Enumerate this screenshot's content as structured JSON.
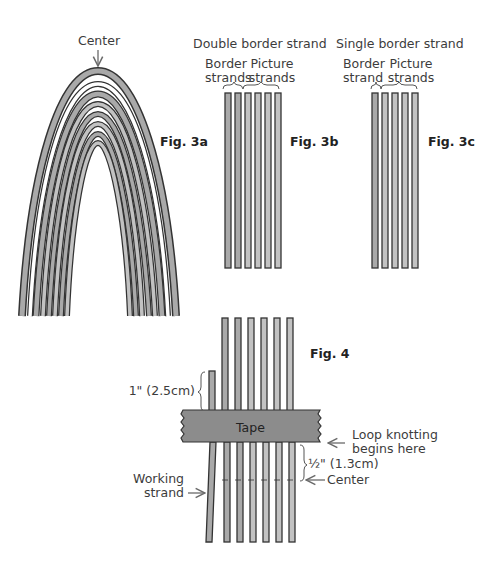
{
  "fig3a": {
    "label": "Fig. 3a",
    "center_label": "Center",
    "arch_strands": 8
  },
  "fig3b": {
    "label": "Fig. 3b",
    "title": "Double border strand",
    "group1": [
      "Border",
      "strands"
    ],
    "group2": [
      "Picture",
      "strands"
    ],
    "border_count": 2,
    "picture_count": 4
  },
  "fig3c": {
    "label": "Fig. 3c",
    "title": "Single border strand",
    "group1": [
      "Border",
      "strand"
    ],
    "group2": [
      "Picture",
      "strands"
    ],
    "border_count": 1,
    "picture_count": 4
  },
  "fig4": {
    "label": "Fig. 4",
    "tape": "Tape",
    "stub_length": "1\" (2.5cm)",
    "gap_length": "½\" (1.3cm)",
    "loop_label": [
      "Loop knotting",
      "begins here"
    ],
    "center_label": "Center",
    "working_label": [
      "Working",
      "strand"
    ]
  },
  "colors": {
    "strand_fill": "#a9a9a9",
    "strand_outline": "#333333",
    "tape_fill": "#8c8c8c",
    "arrow": "#6a6a6a"
  }
}
